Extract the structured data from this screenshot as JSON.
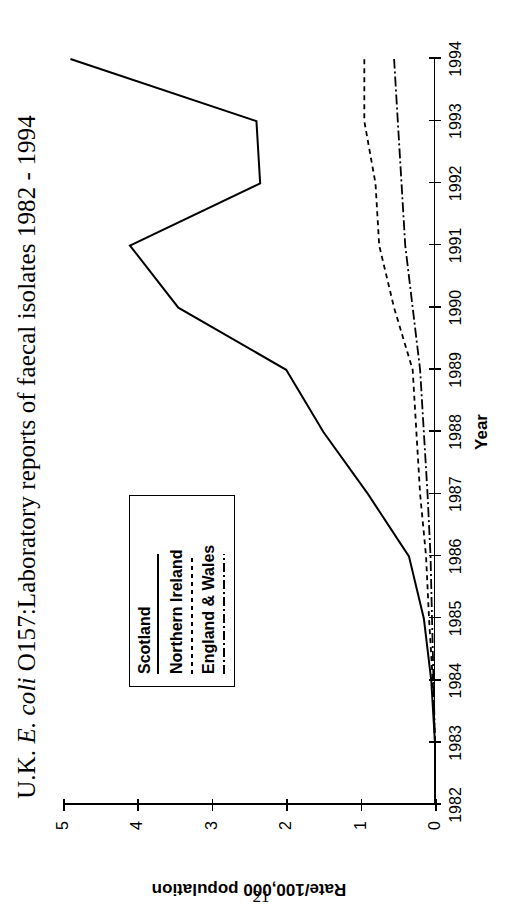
{
  "page": {
    "number": "21"
  },
  "title": {
    "prefix": "U.K. ",
    "italic": "E. coli",
    "suffix": " O157:Laboratory reports of faecal isolates 1982 - 1994",
    "full": "U.K. E. coli O157:Laboratory reports of faecal isolates 1982 - 1994"
  },
  "legend": {
    "items": [
      {
        "label": "Scotland",
        "style": "solid",
        "color": "#000000"
      },
      {
        "label": "Northern Ireland",
        "style": "dashed",
        "color": "#000000"
      },
      {
        "label": "England & Wales",
        "style": "dashdot",
        "color": "#000000"
      }
    ]
  },
  "chart_data": {
    "type": "line",
    "title": "U.K. E. coli O157:Laboratory reports of faecal isolates 1982 - 1994",
    "xlabel": "Year",
    "ylabel": "Rate/100,000 population",
    "x": [
      1982,
      1983,
      1984,
      1985,
      1986,
      1987,
      1988,
      1989,
      1990,
      1991,
      1992,
      1993,
      1994
    ],
    "xticklabels": [
      "1982",
      "1983",
      "1984",
      "1985",
      "1986",
      "1987",
      "1988",
      "1989",
      "1990",
      "1991",
      "1992",
      "1993",
      "1994"
    ],
    "yticks": [
      0,
      1,
      2,
      3,
      4,
      5
    ],
    "yticklabels": [
      "0",
      "1",
      "2",
      "3",
      "4",
      "5"
    ],
    "ylim": [
      0,
      5
    ],
    "xlim": [
      1982,
      1994
    ],
    "grid": false,
    "legend_position": "upper left",
    "series": [
      {
        "name": "Scotland",
        "style": "solid",
        "values": [
          0.0,
          0.0,
          0.05,
          0.15,
          0.35,
          0.9,
          1.5,
          2.0,
          3.45,
          4.1,
          2.35,
          2.4,
          4.9
        ]
      },
      {
        "name": "Northern Ireland",
        "style": "dashed",
        "values": [
          0.0,
          0.0,
          0.03,
          0.08,
          0.12,
          0.2,
          0.25,
          0.3,
          0.55,
          0.75,
          0.8,
          0.95,
          0.95
        ]
      },
      {
        "name": "England & Wales",
        "style": "dashdot",
        "values": [
          0.0,
          0.0,
          0.02,
          0.04,
          0.06,
          0.1,
          0.15,
          0.2,
          0.3,
          0.4,
          0.45,
          0.5,
          0.55
        ]
      }
    ]
  }
}
